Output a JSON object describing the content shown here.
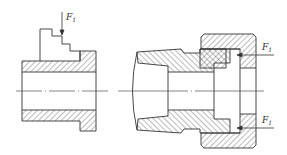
{
  "diagram": {
    "type": "mechanical cross-section",
    "line_color": "#333333",
    "hatch_color": "#555555",
    "background": "#ffffff",
    "left_part": {
      "description": "stepped workpiece / sleeve with flange",
      "force_label": "F",
      "force_subscript": "1"
    },
    "right_part": {
      "description": "collet with clamping nut",
      "force_labels": [
        {
          "label": "F",
          "subscript": "1"
        },
        {
          "label": "F",
          "subscript": "1"
        }
      ]
    }
  }
}
